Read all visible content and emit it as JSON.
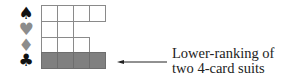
{
  "diagram": {
    "suits": [
      {
        "name": "spades",
        "glyph": "♠",
        "color": "#111111",
        "cells": 4,
        "shaded": false
      },
      {
        "name": "hearts",
        "glyph": "♥",
        "color": "#8c8c8c",
        "cells": 2,
        "shaded": false
      },
      {
        "name": "diamonds",
        "glyph": "♦",
        "color": "#8c8c8c",
        "cells": 3,
        "shaded": false
      },
      {
        "name": "clubs",
        "glyph": "♣",
        "color": "#111111",
        "cells": 4,
        "shaded": true
      }
    ],
    "annotation": {
      "line1": "Lower-ranking of",
      "line2": "two 4-card suits",
      "shade_color": "#808080"
    }
  }
}
